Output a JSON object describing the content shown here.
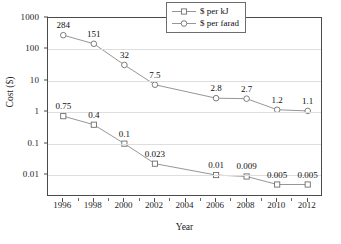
{
  "chart_data": {
    "type": "line",
    "title": "",
    "xlabel": "Year",
    "ylabel": "Cost ($)",
    "x": [
      1996,
      1998,
      2000,
      2002,
      2006,
      2008,
      2010,
      2012
    ],
    "xlim": [
      1995,
      2013
    ],
    "ylim": [
      0.002,
      1000
    ],
    "yscale": "log",
    "xtick_labels": [
      "1996",
      "1998",
      "2000",
      "2002",
      "2004",
      "2006",
      "2008",
      "2010",
      "2012"
    ],
    "xticks": [
      1996,
      1998,
      2000,
      2002,
      2004,
      2006,
      2008,
      2010,
      2012
    ],
    "ytick_labels": [
      "1000",
      "100",
      "10",
      "1",
      "0.1",
      "0.01"
    ],
    "yticks": [
      1000,
      100,
      10,
      1,
      0.1,
      0.01
    ],
    "grid": true,
    "legend_position": "top-right",
    "series": [
      {
        "name": "$ per kJ",
        "marker": "square",
        "color": "#8a8a8a",
        "values": [
          0.75,
          0.4,
          0.1,
          0.023,
          0.01,
          0.009,
          0.005,
          0.005
        ],
        "labels": [
          "0.75",
          "0.4",
          "0.1",
          "0.023",
          "0.01",
          "0.009",
          "0.005",
          "0.005"
        ]
      },
      {
        "name": "$ per farad",
        "marker": "circle",
        "color": "#8a8a8a",
        "values": [
          284,
          151,
          32,
          7.5,
          2.8,
          2.7,
          1.2,
          1.1
        ],
        "labels": [
          "284",
          "151",
          "32",
          "7.5",
          "2.8",
          "2.7",
          "1.2",
          "1.1"
        ]
      }
    ]
  },
  "legend": {
    "items": [
      {
        "label": "$ per kJ",
        "marker": "square"
      },
      {
        "label": "$ per farad",
        "marker": "circle"
      }
    ]
  },
  "axes": {
    "x_title": "Year",
    "y_title": "Cost ($)"
  },
  "colors": {
    "line": "#8a8a8a",
    "marker_stroke": "#6e6e6e",
    "frame": "#4a4a4a",
    "grid": "#dedede",
    "text": "#1c1c1c"
  }
}
